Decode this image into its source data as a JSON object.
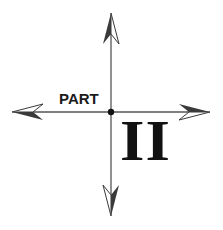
{
  "title": {
    "label": "PART",
    "number": "II"
  },
  "compass": {
    "center": [
      111,
      112
    ],
    "directions": [
      "north",
      "south",
      "west",
      "east"
    ],
    "line_color": "#555555",
    "arrow_color": "#333333",
    "dot_color": "#111111"
  }
}
